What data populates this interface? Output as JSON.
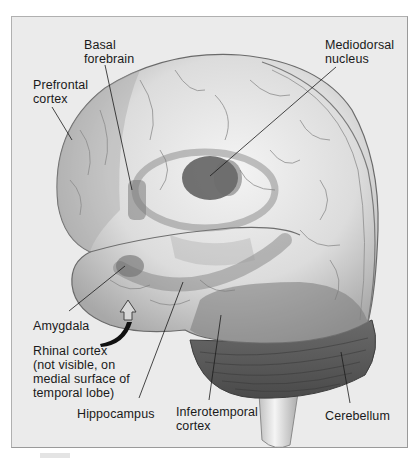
{
  "figure": {
    "labels": [
      {
        "id": "basal-forebrain",
        "text": "Basal\nforebrain",
        "x": 84,
        "y": 38
      },
      {
        "id": "mediodorsal-nucleus",
        "text": "Mediodorsal\nnucleus",
        "x": 325,
        "y": 38
      },
      {
        "id": "prefrontal-cortex",
        "text": "Prefrontal\ncortex",
        "x": 33,
        "y": 78
      },
      {
        "id": "amygdala",
        "text": "Amygdala",
        "x": 33,
        "y": 319
      },
      {
        "id": "rhinal-cortex",
        "text": "Rhinal cortex\n(not visible, on\nmedial surface of\ntemporal lobe)",
        "x": 33,
        "y": 344
      },
      {
        "id": "hippocampus",
        "text": "Hippocampus",
        "x": 77,
        "y": 407
      },
      {
        "id": "inferotemporal-cortex",
        "text": "Inferotemporal\ncortex",
        "x": 176,
        "y": 405
      },
      {
        "id": "cerebellum",
        "text": "Cerebellum",
        "x": 325,
        "y": 409
      }
    ]
  },
  "colors": {
    "background": "#ebebeb",
    "frame_border": "#9a9a9a",
    "brain_light": "#e6e6e6",
    "brain_mid": "#c8c8c8",
    "brain_shadow": "#8c8c8c",
    "highlight_region": "#6e6e6e",
    "cerebellum": "#5a5a5a",
    "leader_line": "#1a1a1a"
  }
}
